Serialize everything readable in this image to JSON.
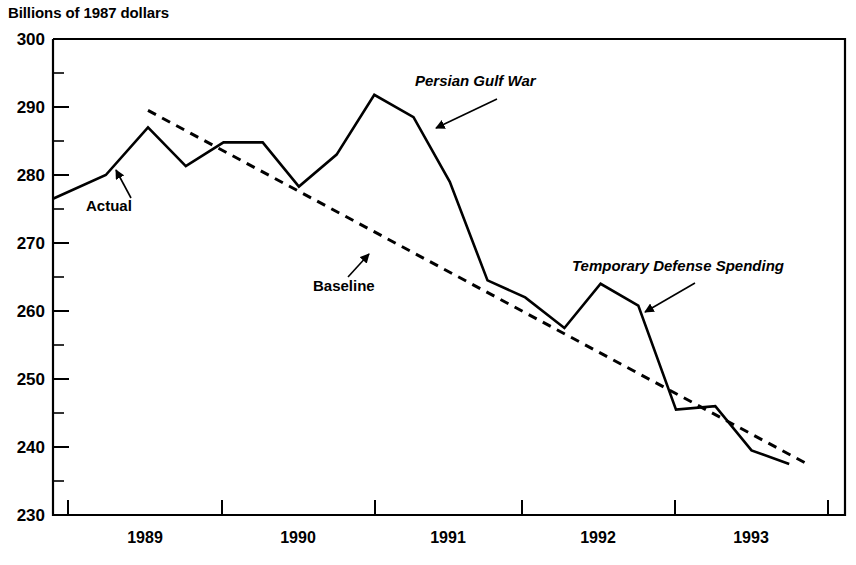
{
  "chart_data": {
    "type": "line",
    "title": "",
    "subtitle": "",
    "ylabel": "Billions of 1987 dollars",
    "xlabel": "",
    "ylim": [
      230,
      300
    ],
    "xlim": [
      1988.5,
      1993.75
    ],
    "grid": false,
    "legend": "none",
    "y_ticks_major": [
      230,
      240,
      250,
      260,
      270,
      280,
      290,
      300
    ],
    "y_ticks_minor": [
      235,
      245,
      255,
      265,
      275,
      285,
      295
    ],
    "x_tick_boundaries": [
      1988.5,
      1989.5,
      1990.5,
      1991.5,
      1992.5,
      1993.5
    ],
    "x_tick_labels": [
      "1989",
      "1990",
      "1991",
      "1992",
      "1993"
    ],
    "series": [
      {
        "name": "Actual",
        "style": "solid",
        "x": [
          1988.5,
          1988.85,
          1989.13,
          1989.38,
          1989.63,
          1989.89,
          1990.13,
          1990.38,
          1990.63,
          1990.89,
          1991.13,
          1991.38,
          1991.63,
          1991.89,
          1992.13,
          1992.38,
          1992.63,
          1992.89,
          1993.13,
          1993.38
        ],
        "values": [
          276.5,
          280.0,
          287.0,
          281.3,
          284.8,
          284.8,
          278.3,
          283.0,
          291.8,
          288.5,
          279.0,
          264.5,
          262.0,
          257.5,
          264.0,
          260.8,
          245.5,
          246.0,
          239.5,
          237.5
        ]
      },
      {
        "name": "Baseline",
        "style": "dashed",
        "x": [
          1989.13,
          1993.5
        ],
        "values": [
          289.5,
          237.5
        ]
      }
    ],
    "annotations": [
      {
        "label": "Actual",
        "italic": false,
        "text_x": 86,
        "text_y": 211,
        "arrow_from_x": 131,
        "arrow_from_y": 198,
        "arrow_to_x": 113,
        "arrow_to_y": 165
      },
      {
        "label": "Baseline",
        "italic": false,
        "text_x": 313,
        "text_y": 291,
        "arrow_from_x": 348,
        "arrow_from_y": 277,
        "arrow_to_x": 372,
        "arrow_to_y": 250
      },
      {
        "label": "Persian Gulf War",
        "italic": true,
        "text_x": 415,
        "text_y": 86,
        "arrow_from_x": 495,
        "arrow_from_y": 100,
        "arrow_to_x": 432,
        "arrow_to_y": 131
      },
      {
        "label": "Temporary Defense Spending",
        "italic": true,
        "text_x": 572,
        "text_y": 271,
        "arrow_from_x": 693,
        "arrow_from_y": 284,
        "arrow_to_x": 641,
        "arrow_to_y": 315
      }
    ]
  }
}
